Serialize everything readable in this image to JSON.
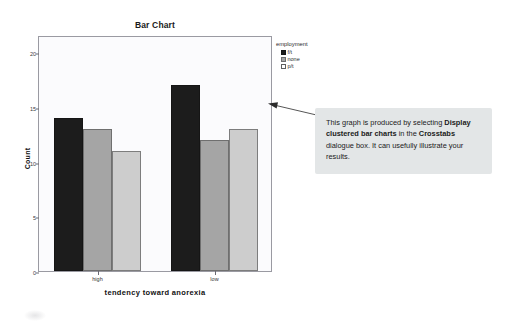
{
  "chart_data": {
    "type": "bar",
    "title": "Bar Chart",
    "xlabel": "tendency toward anorexia",
    "ylabel": "Count",
    "categories": [
      "high",
      "low"
    ],
    "series": [
      {
        "name": "f/t",
        "values": [
          14,
          17
        ],
        "color": "#1c1c1c"
      },
      {
        "name": "none",
        "values": [
          13,
          12
        ],
        "color": "#a5a5a5"
      },
      {
        "name": "p/t",
        "values": [
          11,
          13
        ],
        "color": "#cdcdcd"
      }
    ],
    "legend_title": "employment",
    "legend_position": "right",
    "ylim": [
      0,
      21.6
    ],
    "yticks": [
      0,
      5,
      10,
      15,
      20
    ],
    "ytick_labels": [
      "0",
      "5",
      "10",
      "15",
      "20"
    ],
    "grid": false
  },
  "annotation": {
    "text_part_1": "This graph is produced by selecting ",
    "bold_1": "Display clustered bar charts",
    "text_part_2": " in the ",
    "bold_2": "Crosstabs",
    "text_part_3": " dialogue box. It can usefully illustrate your results."
  }
}
